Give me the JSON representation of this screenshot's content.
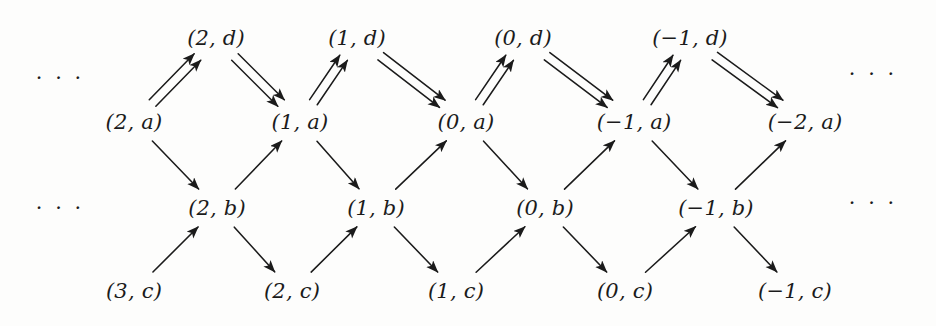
{
  "figure": {
    "kind": "quiver-lattice-diagram",
    "width": 936,
    "height": 326,
    "background_color": "#fdfdfc",
    "ink_color": "#1b1b1b"
  },
  "chart_data": {
    "type": "diagram",
    "title": "",
    "rows": [
      {
        "row_key": "d",
        "letter": "d",
        "y": 38,
        "nodes": [
          {
            "id": "2d",
            "label": "(2, d)",
            "integer": 2,
            "letter": "d",
            "x": 216
          },
          {
            "id": "1d",
            "label": "(1, d)",
            "integer": 1,
            "letter": "d",
            "x": 357
          },
          {
            "id": "0d",
            "label": "(0, d)",
            "integer": 0,
            "letter": "d",
            "x": 523
          },
          {
            "id": "m1d",
            "label": "(−1, d)",
            "integer": -1,
            "letter": "d",
            "x": 690
          }
        ]
      },
      {
        "row_key": "a",
        "letter": "a",
        "y": 122,
        "nodes": [
          {
            "id": "2a",
            "label": "(2, a)",
            "integer": 2,
            "letter": "a",
            "x": 134
          },
          {
            "id": "1a",
            "label": "(1, a)",
            "integer": 1,
            "letter": "a",
            "x": 300
          },
          {
            "id": "0a",
            "label": "(0, a)",
            "integer": 0,
            "letter": "a",
            "x": 466
          },
          {
            "id": "m1a",
            "label": "(−1, a)",
            "integer": -1,
            "letter": "a",
            "x": 634
          },
          {
            "id": "m2a",
            "label": "(−2, a)",
            "integer": -2,
            "letter": "a",
            "x": 805
          }
        ]
      },
      {
        "row_key": "b",
        "letter": "b",
        "y": 208,
        "nodes": [
          {
            "id": "2b",
            "label": "(2, b)",
            "integer": 2,
            "letter": "b",
            "x": 217
          },
          {
            "id": "1b",
            "label": "(1, b)",
            "integer": 1,
            "letter": "b",
            "x": 376
          },
          {
            "id": "0b",
            "label": "(0, b)",
            "integer": 0,
            "letter": "b",
            "x": 545
          },
          {
            "id": "m1b",
            "label": "(−1, b)",
            "integer": -1,
            "letter": "b",
            "x": 716
          }
        ]
      },
      {
        "row_key": "c",
        "letter": "c",
        "y": 291,
        "nodes": [
          {
            "id": "3c",
            "label": "(3, c)",
            "integer": 3,
            "letter": "c",
            "x": 134
          },
          {
            "id": "2c",
            "label": "(2, c)",
            "integer": 2,
            "letter": "c",
            "x": 292
          },
          {
            "id": "1c",
            "label": "(1, c)",
            "integer": 1,
            "letter": "c",
            "x": 456
          },
          {
            "id": "0c",
            "label": "(0, c)",
            "integer": 0,
            "letter": "c",
            "x": 625
          },
          {
            "id": "m1c",
            "label": "(−1, c)",
            "integer": -1,
            "letter": "c",
            "x": 795
          }
        ]
      }
    ],
    "ellipses": [
      {
        "id": "ellipsis-left-top",
        "text": "· · ·",
        "x": 60,
        "y": 78
      },
      {
        "id": "ellipsis-left-bottom",
        "text": "· · ·",
        "x": 60,
        "y": 208
      },
      {
        "id": "ellipsis-right-top",
        "text": "· · ·",
        "x": 873,
        "y": 74
      },
      {
        "id": "ellipsis-right-bottom",
        "text": "· · ·",
        "x": 873,
        "y": 203
      }
    ],
    "edges": [
      {
        "from": "2a",
        "to": "2d",
        "multiplicity": 2,
        "direction": "up-right"
      },
      {
        "from": "2d",
        "to": "1a",
        "multiplicity": 2,
        "direction": "down-right"
      },
      {
        "from": "1a",
        "to": "1d",
        "multiplicity": 2,
        "direction": "up-right"
      },
      {
        "from": "1d",
        "to": "0a",
        "multiplicity": 2,
        "direction": "down-right"
      },
      {
        "from": "0a",
        "to": "0d",
        "multiplicity": 2,
        "direction": "up-right"
      },
      {
        "from": "0d",
        "to": "m1a",
        "multiplicity": 2,
        "direction": "down-right"
      },
      {
        "from": "m1a",
        "to": "m1d",
        "multiplicity": 2,
        "direction": "up-right"
      },
      {
        "from": "m1d",
        "to": "m2a",
        "multiplicity": 2,
        "direction": "down-right"
      },
      {
        "from": "2a",
        "to": "2b",
        "multiplicity": 1,
        "direction": "down-right"
      },
      {
        "from": "2b",
        "to": "1a",
        "multiplicity": 1,
        "direction": "up-right"
      },
      {
        "from": "1a",
        "to": "1b",
        "multiplicity": 1,
        "direction": "down-right"
      },
      {
        "from": "1b",
        "to": "0a",
        "multiplicity": 1,
        "direction": "up-right"
      },
      {
        "from": "0a",
        "to": "0b",
        "multiplicity": 1,
        "direction": "down-right"
      },
      {
        "from": "0b",
        "to": "m1a",
        "multiplicity": 1,
        "direction": "up-right"
      },
      {
        "from": "m1a",
        "to": "m1b",
        "multiplicity": 1,
        "direction": "down-right"
      },
      {
        "from": "m1b",
        "to": "m2a",
        "multiplicity": 1,
        "direction": "up-right"
      },
      {
        "from": "3c",
        "to": "2b",
        "multiplicity": 1,
        "direction": "up-right"
      },
      {
        "from": "2b",
        "to": "2c",
        "multiplicity": 1,
        "direction": "down-right"
      },
      {
        "from": "2c",
        "to": "1b",
        "multiplicity": 1,
        "direction": "up-right"
      },
      {
        "from": "1b",
        "to": "1c",
        "multiplicity": 1,
        "direction": "down-right"
      },
      {
        "from": "1c",
        "to": "0b",
        "multiplicity": 1,
        "direction": "up-right"
      },
      {
        "from": "0b",
        "to": "0c",
        "multiplicity": 1,
        "direction": "down-right"
      },
      {
        "from": "0c",
        "to": "m1b",
        "multiplicity": 1,
        "direction": "up-right"
      },
      {
        "from": "m1b",
        "to": "m1c",
        "multiplicity": 1,
        "direction": "down-right"
      }
    ]
  }
}
